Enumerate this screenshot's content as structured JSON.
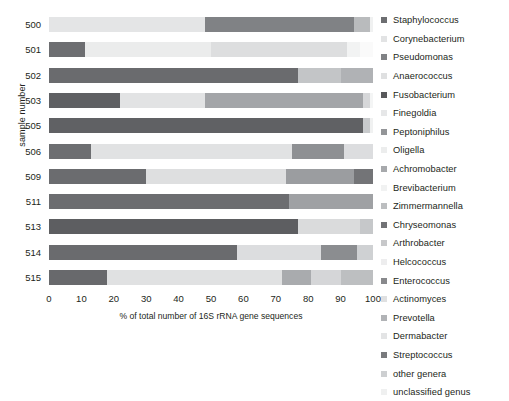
{
  "chart": {
    "type": "bar",
    "title": "",
    "xlabel": "% of total number of 16S rRNA gene sequences",
    "ylabel": "sample number",
    "xlim": [
      0,
      100
    ],
    "xticks": [
      "0",
      "10",
      "20",
      "30",
      "40",
      "50",
      "60",
      "70",
      "80",
      "90",
      "100"
    ],
    "grid": true,
    "legend_position": "right",
    "orientation": "horizontal-stacked"
  },
  "chart_data": {
    "type": "bar",
    "title": "",
    "xlabel": "% of total number of 16S rRNA gene sequences",
    "ylabel": "sample number",
    "xlim": [
      0,
      100
    ],
    "xticks": [
      0,
      10,
      20,
      30,
      40,
      50,
      60,
      70,
      80,
      90,
      100
    ],
    "grid": true,
    "legend_position": "right",
    "categories": [
      "500",
      "501",
      "502",
      "503",
      "505",
      "506",
      "509",
      "511",
      "513",
      "514",
      "515"
    ],
    "series": [
      {
        "name": "Staphylococcus",
        "color": "#6d6e71",
        "values": [
          0.0,
          11.0,
          77.0,
          22.0,
          97.0,
          13.0,
          30.0,
          74.0,
          77.0,
          58.0,
          18.0
        ]
      },
      {
        "name": "Corynebacterium",
        "color": "#e6e7e8",
        "values": [
          48.0,
          0.0,
          0.0,
          0.0,
          0.0,
          0.0,
          0.0,
          0.0,
          0.0,
          0.0,
          0.0
        ]
      },
      {
        "name": "Pseudomonas",
        "color": "#808285",
        "values": [
          46.0,
          0.0,
          0.0,
          0.0,
          0.0,
          0.0,
          0.0,
          0.0,
          0.0,
          0.0,
          0.0
        ]
      },
      {
        "name": "Anaerococcus",
        "color": "#d1d3d4",
        "values": [
          0.0,
          39.0,
          0.0,
          0.0,
          0.0,
          0.0,
          0.0,
          0.0,
          0.0,
          0.0,
          0.0
        ]
      },
      {
        "name": "Fusobacterium",
        "color": "#58595b",
        "values": [
          0.0,
          0.0,
          0.0,
          0.0,
          0.0,
          0.0,
          0.0,
          0.0,
          0.0,
          0.0,
          0.0
        ]
      },
      {
        "name": "Finegoldia",
        "color": "#dcdddf",
        "values": [
          0.0,
          42.0,
          0.0,
          26.0,
          0.0,
          62.0,
          43.0,
          0.0,
          0.0,
          0.0,
          54.0
        ]
      },
      {
        "name": "Peptoniphilus",
        "color": "#939598",
        "values": [
          0.0,
          0.0,
          0.0,
          49.0,
          0.0,
          0.0,
          0.0,
          0.0,
          0.0,
          0.0,
          0.0
        ]
      },
      {
        "name": "Oligella",
        "color": "#e9eaeb",
        "values": [
          0.0,
          0.0,
          0.0,
          0.0,
          0.0,
          0.0,
          0.0,
          0.0,
          0.0,
          0.0,
          0.0
        ]
      },
      {
        "name": "Achromobacter",
        "color": "#a7a9ac",
        "values": [
          0.0,
          0.0,
          0.0,
          0.0,
          0.0,
          0.0,
          0.0,
          26.0,
          0.0,
          0.0,
          0.0
        ]
      },
      {
        "name": "Brevibacterium",
        "color": "#f1f2f2",
        "values": [
          0.0,
          0.0,
          0.0,
          0.0,
          0.0,
          0.0,
          0.0,
          0.0,
          0.0,
          0.0,
          0.0
        ]
      },
      {
        "name": "Zimmermannella",
        "color": "#bcbec0",
        "values": [
          0.0,
          0.0,
          0.0,
          0.0,
          0.0,
          0.0,
          0.0,
          0.0,
          0.0,
          0.0,
          0.0
        ]
      },
      {
        "name": "Chryseomonas",
        "color": "#6d6e71",
        "values": [
          0.0,
          0.0,
          0.0,
          0.0,
          0.0,
          0.0,
          0.0,
          0.0,
          0.0,
          0.0,
          0.0
        ]
      },
      {
        "name": "Arthrobacter",
        "color": "#c7c8ca",
        "values": [
          0.0,
          0.0,
          0.0,
          0.0,
          0.0,
          0.0,
          0.0,
          0.0,
          0.0,
          0.0,
          0.0
        ]
      },
      {
        "name": "Helcococcus",
        "color": "#ededee",
        "values": [
          0.0,
          0.0,
          0.0,
          0.0,
          0.0,
          0.0,
          0.0,
          0.0,
          0.0,
          0.0,
          0.0
        ]
      },
      {
        "name": "Enterococcus",
        "color": "#88898c",
        "values": [
          0.0,
          0.0,
          0.0,
          0.0,
          0.0,
          0.0,
          0.0,
          0.0,
          0.0,
          0.0,
          0.0
        ]
      },
      {
        "name": "Actinomyces",
        "color": "#dfe0e1",
        "values": [
          0.0,
          0.0,
          0.0,
          0.0,
          0.0,
          0.0,
          0.0,
          0.0,
          0.0,
          0.0,
          0.0
        ]
      },
      {
        "name": "Prevotella",
        "color": "#b1b3b6",
        "values": [
          0.0,
          0.0,
          0.0,
          0.0,
          0.0,
          0.0,
          0.0,
          0.0,
          0.0,
          0.0,
          0.0
        ]
      },
      {
        "name": "Dermabacter",
        "color": "#e3e4e5",
        "values": [
          0.0,
          0.0,
          0.0,
          0.0,
          0.0,
          0.0,
          0.0,
          0.0,
          0.0,
          0.0,
          0.0
        ]
      },
      {
        "name": "Streptococcus",
        "color": "#797a7d",
        "values": [
          0.0,
          0.0,
          0.0,
          0.0,
          0.0,
          0.0,
          0.0,
          0.0,
          0.0,
          0.0,
          0.0
        ]
      },
      {
        "name": "other genera",
        "color": "#cdcfd1",
        "values": [
          5.0,
          4.0,
          13.0,
          2.0,
          2.0,
          16.0,
          21.0,
          0.0,
          19.0,
          33.0,
          16.0
        ]
      },
      {
        "name": "unclassified genus",
        "color": "#f5f6f6",
        "values": [
          1.0,
          4.0,
          10.0,
          1.0,
          1.0,
          9.0,
          6.0,
          0.0,
          4.0,
          9.0,
          12.0
        ]
      }
    ],
    "stacks": [
      {
        "sample": "500",
        "segments": [
          {
            "genus": "Corynebacterium",
            "value": 48.0,
            "color": "#e4e5e6"
          },
          {
            "genus": "Pseudomonas",
            "value": 46.0,
            "color": "#808285"
          },
          {
            "genus": "other genera",
            "value": 5.0,
            "color": "#b9bbbd"
          },
          {
            "genus": "unclassified genus",
            "value": 1.0,
            "color": "#f0f1f1"
          }
        ]
      },
      {
        "sample": "501",
        "segments": [
          {
            "genus": "Staphylococcus",
            "value": 11.0,
            "color": "#6d6e71"
          },
          {
            "genus": "Anaerococcus",
            "value": 39.0,
            "color": "#ebecec"
          },
          {
            "genus": "Finegoldia",
            "value": 42.0,
            "color": "#dddedf"
          },
          {
            "genus": "other genera",
            "value": 4.0,
            "color": "#f2f3f3"
          },
          {
            "genus": "unclassified genus",
            "value": 4.0,
            "color": "#fafafa"
          }
        ]
      },
      {
        "sample": "502",
        "segments": [
          {
            "genus": "Staphylococcus",
            "value": 77.0,
            "color": "#6a6b6e"
          },
          {
            "genus": "other genera",
            "value": 13.0,
            "color": "#c3c5c7"
          },
          {
            "genus": "unclassified genus",
            "value": 10.0,
            "color": "#b0b2b5"
          }
        ]
      },
      {
        "sample": "503",
        "segments": [
          {
            "genus": "Staphylococcus",
            "value": 22.0,
            "color": "#5f6063"
          },
          {
            "genus": "Finegoldia",
            "value": 26.0,
            "color": "#e2e3e4"
          },
          {
            "genus": "Peptoniphilus",
            "value": 49.0,
            "color": "#a3a5a8"
          },
          {
            "genus": "other genera",
            "value": 2.0,
            "color": "#d6d7d9"
          },
          {
            "genus": "unclassified genus",
            "value": 1.0,
            "color": "#f4f5f5"
          }
        ]
      },
      {
        "sample": "505",
        "segments": [
          {
            "genus": "Staphylococcus",
            "value": 97.0,
            "color": "#606164"
          },
          {
            "genus": "other genera",
            "value": 2.0,
            "color": "#c8cacc"
          },
          {
            "genus": "unclassified genus",
            "value": 1.0,
            "color": "#f0f1f1"
          }
        ]
      },
      {
        "sample": "506",
        "segments": [
          {
            "genus": "Staphylococcus",
            "value": 13.0,
            "color": "#6d6e71"
          },
          {
            "genus": "Finegoldia",
            "value": 62.0,
            "color": "#e1e2e3"
          },
          {
            "genus": "other genera",
            "value": 16.0,
            "color": "#8e9093"
          },
          {
            "genus": "unclassified genus",
            "value": 9.0,
            "color": "#dcdddf"
          }
        ]
      },
      {
        "sample": "509",
        "segments": [
          {
            "genus": "Staphylococcus",
            "value": 30.0,
            "color": "#6b6c6f"
          },
          {
            "genus": "Finegoldia",
            "value": 43.0,
            "color": "#dedfe0"
          },
          {
            "genus": "other genera",
            "value": 21.0,
            "color": "#9b9da0"
          },
          {
            "genus": "unclassified genus",
            "value": 6.0,
            "color": "#737477"
          }
        ]
      },
      {
        "sample": "511",
        "segments": [
          {
            "genus": "Staphylococcus",
            "value": 74.0,
            "color": "#6c6d70"
          },
          {
            "genus": "Achromobacter",
            "value": 26.0,
            "color": "#9fa1a4"
          }
        ]
      },
      {
        "sample": "513",
        "segments": [
          {
            "genus": "Staphylococcus",
            "value": 77.0,
            "color": "#5d5e61"
          },
          {
            "genus": "other genera",
            "value": 19.0,
            "color": "#dadbdc"
          },
          {
            "genus": "unclassified genus",
            "value": 4.0,
            "color": "#c6c8ca"
          }
        ]
      },
      {
        "sample": "514",
        "segments": [
          {
            "genus": "Staphylococcus",
            "value": 58.0,
            "color": "#6a6b6e"
          },
          {
            "genus": "other genera",
            "value": 26.0,
            "color": "#dcdddf"
          },
          {
            "genus": "unclassified genus",
            "value": 11.0,
            "color": "#8b8d90"
          },
          {
            "genus": "other",
            "value": 5.0,
            "color": "#cfd1d3"
          }
        ]
      },
      {
        "sample": "515",
        "segments": [
          {
            "genus": "Staphylococcus",
            "value": 18.0,
            "color": "#68696c"
          },
          {
            "genus": "Finegoldia",
            "value": 54.0,
            "color": "#e0e1e2"
          },
          {
            "genus": "other genera",
            "value": 9.0,
            "color": "#a9abae"
          },
          {
            "genus": "unclassified genus",
            "value": 9.0,
            "color": "#d5d6d8"
          },
          {
            "genus": "other",
            "value": 10.0,
            "color": "#bdbfc1"
          }
        ]
      }
    ]
  },
  "legend": {
    "items": [
      {
        "label": "Staphylococcus",
        "color": "#6d6e71"
      },
      {
        "label": "Corynebacterium",
        "color": "#e2e3e4"
      },
      {
        "label": "Pseudomonas",
        "color": "#808285"
      },
      {
        "label": "Anaerococcus",
        "color": "#dfe0e1"
      },
      {
        "label": "Fusobacterium",
        "color": "#58595b"
      },
      {
        "label": "Finegoldia",
        "color": "#e6e7e8"
      },
      {
        "label": "Peptoniphilus",
        "color": "#939598"
      },
      {
        "label": "Oligella",
        "color": "#eceded"
      },
      {
        "label": "Achromobacter",
        "color": "#a7a9ac"
      },
      {
        "label": "Brevibacterium",
        "color": "#f1f2f2"
      },
      {
        "label": "Zimmermannella",
        "color": "#bcbec0"
      },
      {
        "label": "Chryseomonas",
        "color": "#727376"
      },
      {
        "label": "Arthrobacter",
        "color": "#c7c8ca"
      },
      {
        "label": "Helcococcus",
        "color": "#ededee"
      },
      {
        "label": "Enterococcus",
        "color": "#88898c"
      },
      {
        "label": "Actinomyces",
        "color": "#dfe0e1"
      },
      {
        "label": "Prevotella",
        "color": "#b1b3b6"
      },
      {
        "label": "Dermabacter",
        "color": "#e3e4e5"
      },
      {
        "label": "Streptococcus",
        "color": "#797a7d"
      },
      {
        "label": "other genera",
        "color": "#cdcfd1"
      },
      {
        "label": "unclassified genus",
        "color": "#eff0f0"
      }
    ]
  }
}
